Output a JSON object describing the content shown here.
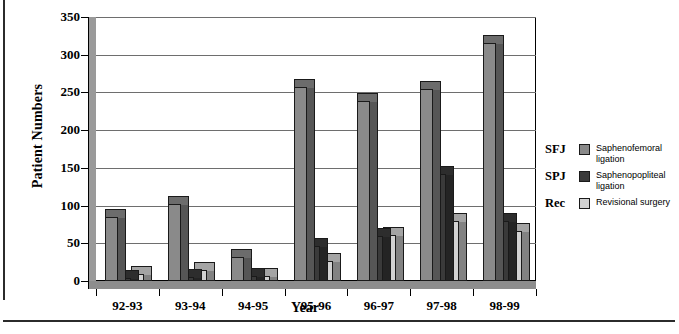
{
  "chart_data": {
    "type": "bar",
    "title": "",
    "xlabel": "Year",
    "ylabel": "Patient Numbers",
    "categories": [
      "92-93",
      "93-94",
      "94-95",
      "95-96",
      "96-97",
      "97-98",
      "98-99"
    ],
    "ylim": [
      0,
      350
    ],
    "yticks": [
      0,
      50,
      100,
      150,
      200,
      250,
      300,
      350
    ],
    "grid": true,
    "legend_position": "right",
    "series": [
      {
        "name": "SFJ",
        "legend_key": "SFJ",
        "label": "Saphenofemoral ligation",
        "color": "#8a8a8a",
        "values": [
          85,
          102,
          32,
          257,
          238,
          254,
          315
        ]
      },
      {
        "name": "SPJ",
        "legend_key": "SPJ",
        "label": "Saphenopopliteal ligation",
        "color": "#3a3a3a",
        "values": [
          4,
          5,
          6,
          47,
          60,
          142,
          80
        ]
      },
      {
        "name": "Rec",
        "legend_key": "Rec",
        "label": "Revisional surgery",
        "color": "#d2d2d2",
        "values": [
          9,
          15,
          7,
          27,
          61,
          80,
          66
        ]
      }
    ]
  },
  "legend": {
    "rows": [
      {
        "key": "SFJ",
        "line1": "Saphenofemoral",
        "line2": "ligation"
      },
      {
        "key": "SPJ",
        "line1": "Saphenopopliteal",
        "line2": "ligation"
      },
      {
        "key": "Rec",
        "line1": "Revisional surgery",
        "line2": ""
      }
    ]
  },
  "colors": {
    "sfj": "#8a8a8a",
    "spj": "#3a3a3a",
    "rec": "#d2d2d2",
    "axis": "#000000",
    "grid": "#6e6e6e",
    "floor": "#8d8d8d"
  }
}
